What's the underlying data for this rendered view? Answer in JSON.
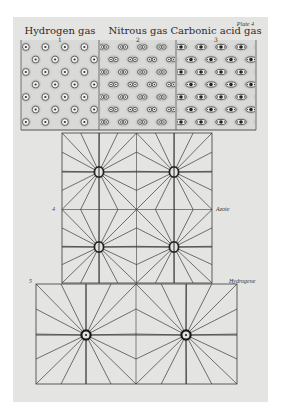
{
  "plate": {
    "plate_label": "Plate 4",
    "paper_color": "#e4e4e2",
    "ink_color": "#3a3a3a",
    "paper": {
      "x": 13,
      "y": 17,
      "w": 255,
      "h": 385
    }
  },
  "gas_panel": {
    "x": 21,
    "y": 40,
    "w": 235,
    "h": 90,
    "dividers_x": [
      99,
      176
    ],
    "columns": [
      {
        "title": "Hydrogen gas",
        "number": "1",
        "molecule": "single",
        "x0": 21,
        "x1": 99
      },
      {
        "title": "Nitrous gas",
        "number": "2",
        "molecule": "double",
        "x0": 99,
        "x1": 176
      },
      {
        "title": "Carbonic acid gas",
        "number": "3",
        "molecule": "triple",
        "x0": 176,
        "x1": 256
      }
    ]
  },
  "figure_4": {
    "number": "4",
    "side_label": "Azote",
    "x": 62,
    "y": 133,
    "w": 150,
    "h": 150,
    "centers": [
      [
        99,
        172
      ],
      [
        174,
        172
      ],
      [
        99,
        247
      ],
      [
        174,
        247
      ]
    ],
    "atom_style": "ring"
  },
  "figure_5": {
    "number": "5",
    "side_label": "Hydrogene",
    "x": 36,
    "y": 284,
    "w": 201,
    "h": 100,
    "centers": [
      [
        86,
        335
      ],
      [
        186,
        335
      ]
    ],
    "atom_style": "dot-ring"
  }
}
